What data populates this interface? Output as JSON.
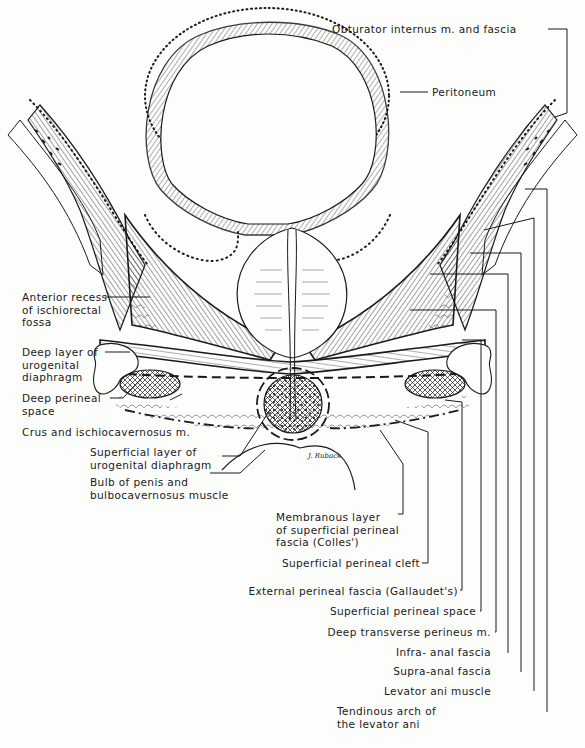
{
  "figure": {
    "type": "anatomical cross-section illustration",
    "signature": "J. Ruback",
    "colors": {
      "ink": "#1a1a1a",
      "paper": "#fdfdfc"
    }
  },
  "labels": {
    "left": [
      {
        "id": "anterior-recess",
        "text": "Anterior recess\nof ischiorectal\nfossa"
      },
      {
        "id": "deep-layer-ugd",
        "text": "Deep layer of\nurogenital\ndiaphragm"
      },
      {
        "id": "deep-perineal-space",
        "text": "Deep perineal\nspace"
      },
      {
        "id": "crus-ischiocavernosus",
        "text": "Crus and ischiocavernosus m."
      },
      {
        "id": "superficial-layer-ugd",
        "text": "Superficial layer of\nurogenital diaphragm"
      },
      {
        "id": "bulb-of-penis",
        "text": "Bulb of penis and\nbulbocavernosus muscle"
      }
    ],
    "top": [
      {
        "id": "obturator-internus",
        "text": "Obturator internus m. and fascia"
      },
      {
        "id": "peritoneum",
        "text": "Peritoneum"
      }
    ],
    "bottom_right": [
      {
        "id": "membranous-layer",
        "text": "Membranous layer\nof superficial perineal\nfascia (Colles')"
      },
      {
        "id": "superficial-perineal-cleft",
        "text": "Superficial perineal cleft"
      },
      {
        "id": "external-perineal-fascia",
        "text": "External perineal fascia (Gallaudet's)"
      },
      {
        "id": "superficial-perineal-space",
        "text": "Superficial perineal space"
      },
      {
        "id": "deep-transverse-perineus",
        "text": "Deep transverse perineus m."
      },
      {
        "id": "infra-anal-fascia",
        "text": "Infra- anal fascia"
      },
      {
        "id": "supra-anal-fascia",
        "text": "Supra-anal fascia"
      },
      {
        "id": "levator-ani-muscle",
        "text": "Levator ani muscle"
      },
      {
        "id": "tendinous-arch",
        "text": "Tendinous arch of\nthe levator ani"
      }
    ]
  }
}
